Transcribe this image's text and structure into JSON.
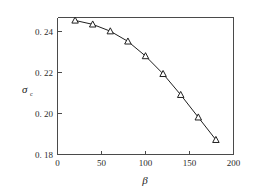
{
  "chart_data": {
    "type": "line",
    "title": "",
    "xlabel": "β",
    "ylabel": "σ",
    "ylabel_subscript": "c",
    "x": [
      20,
      40,
      60,
      80,
      100,
      120,
      140,
      160,
      180
    ],
    "values": [
      0.2485,
      0.2465,
      0.243,
      0.2378,
      0.2303,
      0.2212,
      0.2105,
      0.199,
      0.1875
    ],
    "series": [
      {
        "name": "sigma_c vs beta",
        "marker": "triangle-up",
        "values": [
          0.2485,
          0.2465,
          0.243,
          0.2378,
          0.2303,
          0.2212,
          0.2105,
          0.199,
          0.1875
        ]
      }
    ],
    "xlim": [
      0,
      200
    ],
    "ylim": [
      0.18,
      0.25
    ],
    "xticks": [
      0,
      50,
      100,
      150,
      200
    ],
    "xtick_labels": [
      "0",
      "50",
      "100",
      "150",
      "200"
    ],
    "yticks": [
      0.18,
      0.2,
      0.22,
      0.24
    ],
    "ytick_labels": [
      "0. 18",
      "0. 20",
      "0. 22",
      "0. 24"
    ],
    "grid": false,
    "legend": null,
    "line_color": "#1f1f1f",
    "marker_face_color": "#ffffff",
    "marker_edge_color": "#1f1f1f",
    "axis_color": "#4a4a4a",
    "background_color": "#ffffff"
  }
}
